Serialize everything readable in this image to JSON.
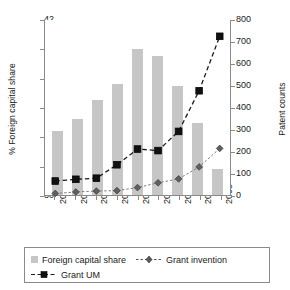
{
  "chart_data": {
    "type": "bar",
    "title": "",
    "categories": [
      "2000",
      "2001",
      "2002",
      "2003",
      "2004",
      "2005",
      "2006",
      "2007",
      "2008"
    ],
    "xlabel": "",
    "ylabel": "% Foreign capital share",
    "ylabel_secondary": "Patent counts",
    "ylim": [
      30,
      42
    ],
    "ylim_secondary": [
      0,
      800
    ],
    "yticks": [
      30,
      32,
      34,
      36,
      38,
      40,
      42
    ],
    "yticks_secondary": [
      0,
      100,
      200,
      300,
      400,
      500,
      600,
      700,
      800
    ],
    "grid": false,
    "legend_position": "bottom",
    "series": [
      {
        "name": "Foreign capital share",
        "type": "bar",
        "axis": "left",
        "color": "#c6c6c6",
        "values": [
          34.35,
          35.15,
          36.45,
          37.6,
          39.95,
          39.5,
          37.45,
          34.9,
          31.8
        ]
      },
      {
        "name": "Grant invention",
        "type": "line",
        "axis": "right",
        "marker": "diamond",
        "linestyle": "dotted",
        "color": "#7a7a7a",
        "values": [
          3,
          10,
          14,
          16,
          30,
          52,
          70,
          125,
          210
        ]
      },
      {
        "name": "Grant UM",
        "type": "line",
        "axis": "right",
        "marker": "square",
        "linestyle": "dashed",
        "color": "#1a1a1a",
        "values": [
          60,
          68,
          73,
          135,
          207,
          200,
          288,
          475,
          725
        ]
      }
    ]
  },
  "legend": {
    "items": [
      {
        "label": "Foreign capital share",
        "marker": "bar-swatch"
      },
      {
        "label": "Grant invention",
        "marker": "dotted-diamond"
      },
      {
        "label": "Grant UM",
        "marker": "dashed-square"
      }
    ]
  }
}
